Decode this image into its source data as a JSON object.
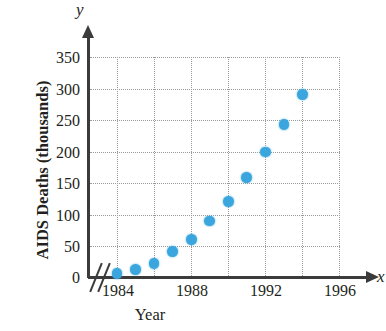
{
  "chart_data": {
    "type": "scatter",
    "title": "",
    "xlabel": "Year",
    "ylabel": "AIDS Deaths (thousands)",
    "x_variable": "x",
    "y_variable": "y",
    "grid": true,
    "legend": "none",
    "axis_break": "//",
    "xlim": [
      1983,
      1997
    ],
    "ylim": [
      0,
      350
    ],
    "xticks": [
      "1984",
      "1988",
      "1992",
      "1996"
    ],
    "yticks": [
      "0",
      "50",
      "100",
      "150",
      "200",
      "250",
      "300",
      "350"
    ],
    "x": [
      1984,
      1985,
      1986,
      1987,
      1988,
      1989,
      1990,
      1991,
      1992,
      1993,
      1994
    ],
    "values": [
      7,
      13,
      22,
      41,
      61,
      90,
      121,
      159,
      200,
      244,
      292
    ],
    "points": [
      {
        "year": 1984,
        "deaths": 7
      },
      {
        "year": 1985,
        "deaths": 13
      },
      {
        "year": 1986,
        "deaths": 22
      },
      {
        "year": 1987,
        "deaths": 41
      },
      {
        "year": 1988,
        "deaths": 61
      },
      {
        "year": 1989,
        "deaths": 90
      },
      {
        "year": 1990,
        "deaths": 121
      },
      {
        "year": 1991,
        "deaths": 159
      },
      {
        "year": 1992,
        "deaths": 200
      },
      {
        "year": 1993,
        "deaths": 244
      },
      {
        "year": 1994,
        "deaths": 292
      }
    ],
    "marker_color": "#3aa6dd",
    "axis_color": "#3b3b3b",
    "grid_color": "#9a9a9a"
  },
  "axes": {
    "y_title": "AIDS Deaths (thousands)",
    "x_title": "Year",
    "y_variable": "y",
    "x_variable": "x",
    "y_ticks": [
      {
        "label": "350",
        "value": 350
      },
      {
        "label": "300",
        "value": 300
      },
      {
        "label": "250",
        "value": 250
      },
      {
        "label": "200",
        "value": 200
      },
      {
        "label": "150",
        "value": 150
      },
      {
        "label": "100",
        "value": 100
      },
      {
        "label": "50",
        "value": 50
      },
      {
        "label": "0",
        "value": 0
      }
    ],
    "x_ticks": [
      {
        "label": "1984",
        "value": 1984
      },
      {
        "label": "1988",
        "value": 1988
      },
      {
        "label": "1992",
        "value": 1992
      },
      {
        "label": "1996",
        "value": 1996
      }
    ]
  }
}
